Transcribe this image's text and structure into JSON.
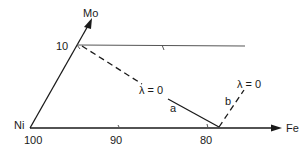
{
  "diagram": {
    "type": "ternary-composition-section",
    "axes": {
      "vertex_origin": "Ni",
      "axis_right": "Fe",
      "axis_up": "Mo"
    },
    "tick_labels": {
      "origin": "100",
      "bottom": [
        "90",
        "80"
      ],
      "left": [
        "10"
      ]
    },
    "curves": [
      {
        "id": "a",
        "label": "a",
        "style": "solid",
        "annotation": "λ = 0"
      },
      {
        "id": "b",
        "label": "b",
        "style": "dashed",
        "annotation": "λ = 0"
      }
    ],
    "upper_dashed_annotation": "λ = 0"
  }
}
